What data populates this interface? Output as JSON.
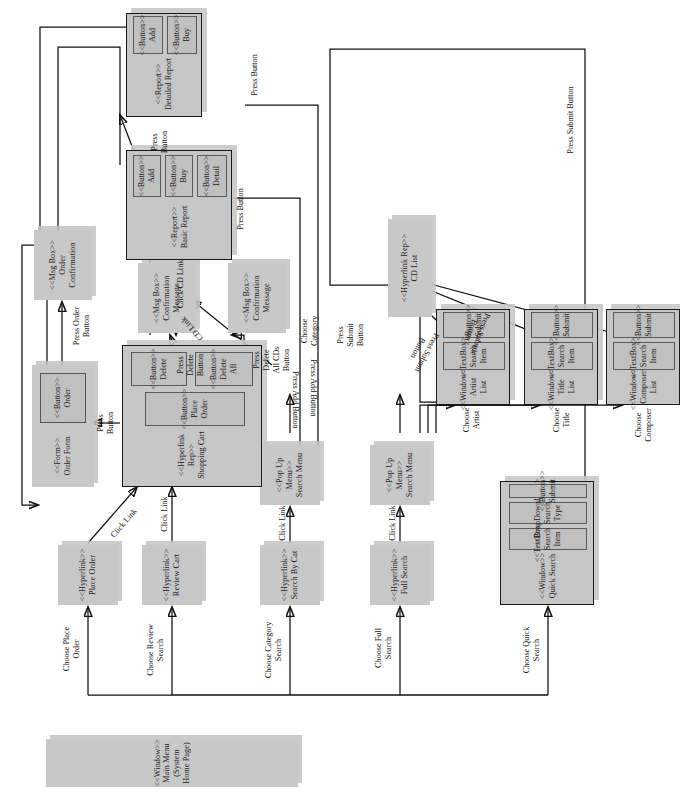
{
  "diagram": {
    "kind": "UML navigation / state diagram",
    "orientation": "rotated-90",
    "colors": {
      "node_fill": "#c8c8c8",
      "node_stroke": "#1a1a1a",
      "page_bg": "#ffffff",
      "shadow": "#c3c3c3"
    }
  },
  "nodes": {
    "main_menu": {
      "stereotype": "<<Window>>",
      "line1": "Main Menu",
      "line2": "(System Home Page)"
    },
    "hyperlink_place_order": {
      "stereotype": "<<Hyperlink>>",
      "line1": "Place Order"
    },
    "hyperlink_review_cart": {
      "stereotype": "<<Hyperlink>>",
      "line1": "Review Cart"
    },
    "hyperlink_search_by_cat": {
      "stereotype": "<<Hyperlink>>",
      "line1": "Search By Cat"
    },
    "hyperlink_full_search": {
      "stereotype": "<<Hyperlink>>",
      "line1": "Full Search"
    },
    "popup_search_menu_cat": {
      "stereotype": "<<Pop Up Menu>>",
      "line1": "Search Menu"
    },
    "popup_search_menu_full": {
      "stereotype": "<<Pop Up Menu>>",
      "line1": "Search Menu"
    },
    "order_form": {
      "stereotype": "<<Form>>",
      "line1": "Order Form"
    },
    "order_button": {
      "stereotype": "<<Button>>",
      "line1": "Order"
    },
    "msgbox_order_confirmation": {
      "stereotype": "<<Msg Box>>",
      "line1": "Order",
      "line2": "Confirmation"
    },
    "msgbox_confirmation_message_1": {
      "stereotype": "<<Msg Box>>",
      "line1": "Confirmation",
      "line2": "Message"
    },
    "msgbox_confirmation_message_2": {
      "stereotype": "<<Msg Box>>",
      "line1": "Confirmation",
      "line2": "Message"
    },
    "shopping_cart": {
      "stereotype": "<<Hyperlink Rep>>",
      "line1": "Shopping Cart"
    },
    "cart_place_order_button": {
      "stereotype": "<<Button>>",
      "line1": "Place Order"
    },
    "cart_delete_button": {
      "stereotype": "<<Button>>",
      "line1": "Delete"
    },
    "cart_delete_all_button": {
      "stereotype": "<<Button>>",
      "line1": "Delete All"
    },
    "cd_list": {
      "stereotype": "<<Hyperlink Rep>>",
      "line1": "CD List"
    },
    "basic_report": {
      "stereotype": "<<Report>>",
      "line1": "Basic Report"
    },
    "basic_add_button": {
      "stereotype": "<<Button>>",
      "line1": "Add"
    },
    "basic_buy_button": {
      "stereotype": "<<Button>>",
      "line1": "Buy"
    },
    "basic_detail_button": {
      "stereotype": "<<Button>>",
      "line1": "Detail"
    },
    "detailed_report": {
      "stereotype": "<<Report>>",
      "line1": "Detailed Report"
    },
    "detailed_add_button": {
      "stereotype": "<<Button>>",
      "line1": "Add"
    },
    "detailed_buy_button": {
      "stereotype": "<<Button>>",
      "line1": "Buy"
    },
    "quick_search": {
      "stereotype": "<<Window>>",
      "line1": "Quick Search"
    },
    "quick_textbox": {
      "stereotype": "<<TextBox>>",
      "line1": "Search Item"
    },
    "quick_dropdown": {
      "stereotype": "<<DropDownList>>",
      "line1": "Search Type"
    },
    "quick_submit": {
      "stereotype": "<<Button>>",
      "line1": "Submit"
    },
    "artist_list": {
      "stereotype": "<<Window>>",
      "line1": "Artist List"
    },
    "artist_textbox": {
      "stereotype": "<<TextBox>>",
      "line1": "Search Item"
    },
    "artist_submit": {
      "stereotype": "<<Button>>",
      "line1": "Submit"
    },
    "title_list": {
      "stereotype": "<<Window>>",
      "line1": "Title List"
    },
    "title_textbox": {
      "stereotype": "<<TextBox>>",
      "line1": "Search Item"
    },
    "title_submit": {
      "stereotype": "<<Button>>",
      "line1": "Submit"
    },
    "composer_list": {
      "stereotype": "<<Window>>",
      "line1": "Composer List"
    },
    "composer_textbox": {
      "stereotype": "<<TextBox>>",
      "line1": "Search Item"
    },
    "composer_submit": {
      "stereotype": "<<Button>>",
      "line1": "Submit"
    }
  },
  "edge_labels": {
    "choose_place_order": "Choose Place\nOrder",
    "choose_review_search": "Choose Review\nSearch",
    "choose_category_search": "Choose Category\nSearch",
    "choose_full_search": "Choose Full\nSearch",
    "choose_quick_search": "Choose Quick\nSearch",
    "click_link_1": "Click Link",
    "click_link_2": "Click Link",
    "click_link_3": "Click Link",
    "click_link_4": "Click Link",
    "click_cd_link_1": "Click CD Link",
    "click_cd_link_2": "CD Link",
    "press_button_cart_to_form": "Press\nButton",
    "press_order_button": "Press Order\nButton",
    "press_delete_button": "Press\nDelete\nButton",
    "press_delete_all_cds_button": "Press\nDelete\nAll CDs\nButton",
    "press_add_button_1": "Press Add Button",
    "press_add_button_2": "Press Add Button",
    "press_button_detail": "Press\nButton",
    "press_button_right_1": "Press Button",
    "press_button_right_2": "Press Button",
    "choose_category": "Choose\nCategory",
    "choose_artist": "Choose\nArtist",
    "choose_title": "Choose\nTitle",
    "choose_composer": "Choose\nComposer",
    "press_submit_button_1": "Press\nSubmit\nButton",
    "press_submit_button_2": "Press Submit\nButton",
    "press_submit_button_3": "Press Submit\nButton",
    "press_submit_button_4": "Press Submit Button"
  }
}
